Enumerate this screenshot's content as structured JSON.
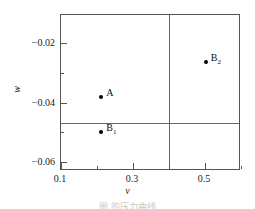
{
  "figure": {
    "caption": "图                          的压力曲线"
  },
  "chart_data": {
    "type": "scatter",
    "title": "",
    "xlabel": "v",
    "ylabel": "w",
    "xlim": [
      0.1,
      0.6
    ],
    "ylim": [
      -0.063,
      -0.0105
    ],
    "grid": false,
    "legend": "none",
    "x_ticks": [
      {
        "value": 0.1,
        "label": "0.1",
        "type": "major"
      },
      {
        "value": 0.2,
        "label": "",
        "type": "minor"
      },
      {
        "value": 0.3,
        "label": "0.3",
        "type": "major"
      },
      {
        "value": 0.4,
        "label": "",
        "type": "minor"
      },
      {
        "value": 0.5,
        "label": "0.5",
        "type": "major"
      },
      {
        "value": 0.6,
        "label": "",
        "type": "minor"
      }
    ],
    "y_ticks": [
      {
        "value": -0.02,
        "label": "−0.02",
        "type": "major"
      },
      {
        "value": -0.03,
        "label": "",
        "type": "minor"
      },
      {
        "value": -0.04,
        "label": "−0.04",
        "type": "major"
      },
      {
        "value": -0.05,
        "label": "",
        "type": "minor"
      },
      {
        "value": -0.06,
        "label": "−0.06",
        "type": "major"
      }
    ],
    "points": [
      {
        "name": "A",
        "label": "A",
        "sub": "",
        "x": 0.212,
        "y": -0.038
      },
      {
        "name": "B1",
        "label": "B",
        "sub": "1",
        "x": 0.212,
        "y": -0.0498
      },
      {
        "name": "B2",
        "label": "B",
        "sub": "2",
        "x": 0.502,
        "y": -0.0262
      }
    ],
    "reference_lines": [
      {
        "name": "vertical-reference",
        "orientation": "vertical",
        "value": 0.4
      },
      {
        "name": "horizontal-reference",
        "orientation": "horizontal",
        "value": -0.047
      }
    ],
    "colors": {
      "marker": "#000000",
      "frame": "#555555",
      "reference_line": "#666666",
      "background": "#ffffff"
    }
  }
}
